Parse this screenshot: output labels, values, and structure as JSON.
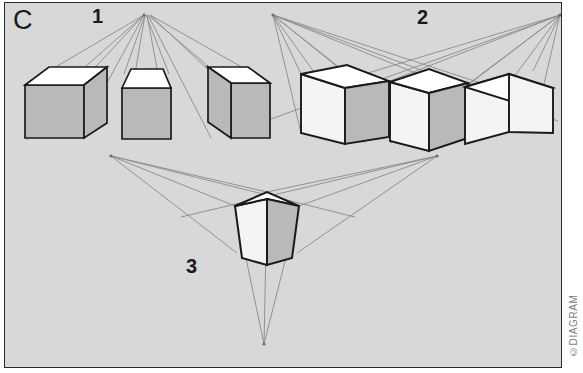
{
  "figure": {
    "plate_letter": "C",
    "title_hidden": "",
    "background_color": "#d8d8d8",
    "border_color": "#2b2b2b",
    "page_background": "#ffffff",
    "copyright": "©DIAGRAM",
    "width": 583,
    "height": 373
  },
  "style": {
    "cube_top_fill": "#ffffff",
    "cube_front_fill": "#f4f4f4",
    "cube_side_fill": "#b9b9b9",
    "cube_edge_color": "#1a1a1a",
    "guide_line_color": "#8a8a8a",
    "vanishing_point_color": "#6e6e6e"
  },
  "groups": [
    {
      "id": "group-1",
      "label": "1",
      "label_x": 87,
      "label_y": 3,
      "perspective": "one-point",
      "vanishing_points": [
        {
          "name": "vp-center",
          "x": 143,
          "y": 13
        }
      ],
      "cube_count": 3
    },
    {
      "id": "group-2",
      "label": "2",
      "label_x": 412,
      "label_y": 4,
      "perspective": "two-point",
      "vanishing_points": [
        {
          "name": "vp-left",
          "x": 272,
          "y": 13
        },
        {
          "name": "vp-right",
          "x": 559,
          "y": 13
        }
      ],
      "cube_count": 3
    },
    {
      "id": "group-3",
      "label": "3",
      "label_x": 181,
      "label_y": 253,
      "perspective": "three-point",
      "vanishing_points": [
        {
          "name": "vp-left",
          "x": 110,
          "y": 155
        },
        {
          "name": "vp-right",
          "x": 436,
          "y": 155
        },
        {
          "name": "vp-bottom",
          "x": 263,
          "y": 344
        }
      ],
      "cube_count": 1
    }
  ]
}
